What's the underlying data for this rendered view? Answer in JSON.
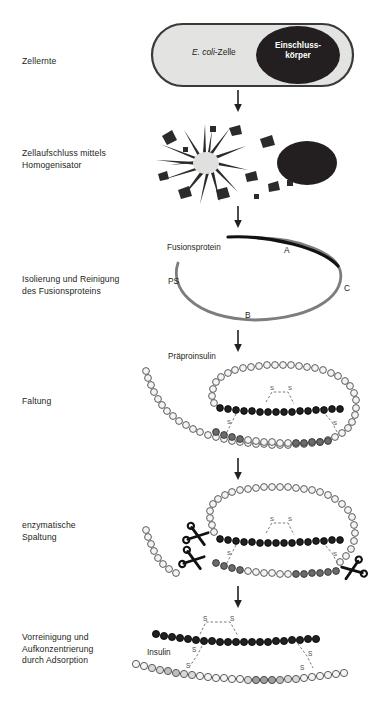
{
  "diagram": {
    "title_language": "de",
    "stages": [
      {
        "id": "harvest",
        "label": "Zellernte",
        "label_xy": [
          22,
          56
        ],
        "figure": "ecoli-cell",
        "cell_text_plain": "-Zelle",
        "cell_text_italic": "E. coli",
        "inclusion_body_text": "Einschluss-\nkörper"
      },
      {
        "id": "disruption",
        "label": "Zellaufschluss mittels\nHomogenisator",
        "label_xy": [
          22,
          148
        ],
        "figure": "cell-lysis-burst"
      },
      {
        "id": "isolation",
        "label": "Isolierung und Reinigung\ndes Fusionsproteins",
        "label_xy": [
          22,
          274
        ],
        "figure": "fusion-protein-loop",
        "annotations": {
          "fusion_protein": "Fusionsprotein",
          "chain_a": "A",
          "chain_b": "B",
          "chain_c": "C",
          "signal": "PS"
        }
      },
      {
        "id": "folding",
        "label": "Faltung",
        "label_xy": [
          22,
          396
        ],
        "figure": "preproinsulin-folded",
        "annotations": {
          "preproinsulin": "Präproinsulin",
          "disulfide": "S"
        }
      },
      {
        "id": "cleavage",
        "label": "enzymatische\nSpaltung",
        "label_xy": [
          22,
          520
        ],
        "figure": "enzymatic-cleavage",
        "annotations": {
          "disulfide": "S"
        }
      },
      {
        "id": "adsorption",
        "label": "Vorreinigung und\nAufkonzentrierung\ndurch Adsorption",
        "label_xy": [
          22,
          632
        ],
        "figure": "insulin-two-chains",
        "annotations": {
          "insulin": "Insulin",
          "disulfide": "S"
        }
      }
    ],
    "arrows": [
      {
        "name": "arrow-harvest-to-disruption",
        "y": 90
      },
      {
        "name": "arrow-disruption-to-isolation",
        "y": 206
      },
      {
        "name": "arrow-isolation-to-folding",
        "y": 330
      },
      {
        "name": "arrow-folding-to-cleavage",
        "y": 458
      },
      {
        "name": "arrow-cleavage-to-adsorption",
        "y": 586
      }
    ],
    "colors": {
      "cell_fill": "#e3e3e1",
      "cell_stroke": "#3a3a38",
      "inclusion_body": "#231f20",
      "loop_gray": "#7d7d7d",
      "loop_black": "#111111",
      "bead_dark": "#231f20",
      "bead_light": "#f2f2f2",
      "bead_stroke": "#5b5b5b",
      "text": "#231f20",
      "debris": "#2b2b2b",
      "burst_core": "#e0e0de"
    }
  }
}
